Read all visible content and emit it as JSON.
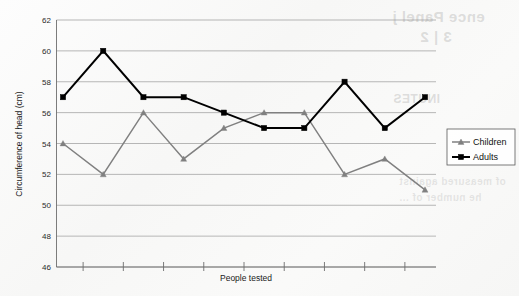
{
  "chart_data": {
    "type": "line",
    "title": "",
    "xlabel": "People tested",
    "ylabel": "Circumference of head (cm)",
    "ylim": [
      46,
      62
    ],
    "yticks": [
      46,
      48,
      50,
      52,
      54,
      56,
      58,
      60,
      62
    ],
    "ytick_labels": [
      "46",
      "48",
      "50",
      "52",
      "54",
      "56",
      "58",
      "60",
      "62"
    ],
    "xtick_labels": [
      "",
      "",
      "",
      "",
      "",
      "",
      "",
      "",
      "",
      ""
    ],
    "x": [
      1,
      2,
      3,
      4,
      5,
      6,
      7,
      8,
      9,
      10
    ],
    "grid": true,
    "legend_position": "right",
    "series": [
      {
        "name": "Children",
        "values": [
          54,
          52,
          56,
          53,
          55,
          56,
          56,
          52,
          53,
          51
        ],
        "color": "#808080",
        "marker": "triangle"
      },
      {
        "name": "Adults",
        "values": [
          57,
          60,
          57,
          57,
          56,
          55,
          55,
          58,
          55,
          57
        ],
        "color": "#000000",
        "marker": "square"
      }
    ]
  },
  "legend": {
    "items": [
      {
        "label": "Children"
      },
      {
        "label": "Adults"
      }
    ]
  },
  "bleed_through": {
    "line1": "ence Panel j",
    "line2": "3 | 2",
    "line3": "INUTES",
    "line4": "of measured against",
    "line5": "he number of ..."
  }
}
